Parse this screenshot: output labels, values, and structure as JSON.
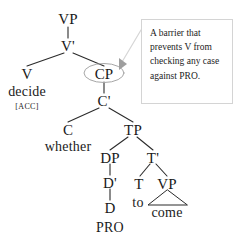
{
  "diagram": {
    "type": "syntax-tree",
    "background_color": "#ffffff",
    "line_color": "#2b2b2b",
    "nodes": {
      "vp_top": "VP",
      "vbar": "V'",
      "v": "V",
      "v_lex": "decide",
      "v_feature": "[ACC]",
      "cp": "CP",
      "cbar": "C'",
      "c": "C",
      "c_lex": "whether",
      "tp": "TP",
      "dp": "DP",
      "dbar": "D'",
      "d": "D",
      "d_lex": "PRO",
      "tbar": "T'",
      "t": "T",
      "t_lex": "to",
      "vp_low": "VP",
      "vp_low_lex": "come"
    },
    "annotation": {
      "text": "A barrier that prevents V from checking any case against PRO.",
      "lines": [
        "A barrier that",
        "prevents V",
        "from checking",
        "any case",
        "against PRO."
      ],
      "border_color": "#d4d4d4",
      "background_color": "#ffffff",
      "pointer": "right-triangle-marker",
      "target_node": "CP"
    },
    "highlight": {
      "shape": "ellipse",
      "around": "CP",
      "color": "#9a9a9a"
    }
  }
}
